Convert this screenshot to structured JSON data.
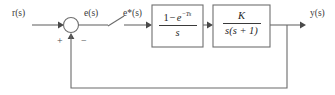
{
  "diagram": {
    "signals": {
      "input": "r(s)",
      "error": "e(s)",
      "sampled_error": "e*(s)",
      "output": "y(s)"
    },
    "summing_junction": {
      "name": "summing-junction",
      "plus_sign": "+",
      "minus_sign": "−"
    },
    "sampler": {
      "name": "sampler-switch",
      "label": ""
    },
    "blocks": [
      {
        "name": "zero-order-hold",
        "numerator_prefix": "1",
        "numerator_operator": "−",
        "numerator_base": "e",
        "numerator_exponent": "−Ts",
        "denominator": "s"
      },
      {
        "name": "plant",
        "numerator": "K",
        "denominator": "s(s + 1)"
      }
    ],
    "colors": {
      "line": "#6b6b6b",
      "box": "#6f6f6f",
      "text": "#1f1f1f",
      "background": "#ffffff"
    }
  }
}
